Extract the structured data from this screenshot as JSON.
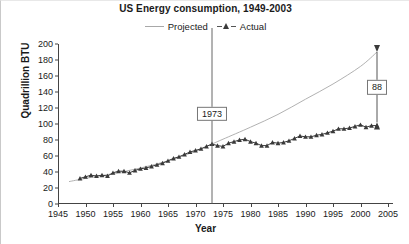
{
  "chart_data": {
    "type": "line",
    "title": "US Energy consumption, 1949-2003",
    "xlabel": "Year",
    "ylabel": "Quadrillion BTU",
    "xlim": [
      1945,
      2005
    ],
    "ylim": [
      0,
      200
    ],
    "xticks": [
      1945,
      1950,
      1955,
      1960,
      1965,
      1970,
      1975,
      1980,
      1985,
      1990,
      1995,
      2000,
      2005
    ],
    "yticks": [
      0,
      20,
      40,
      60,
      80,
      100,
      120,
      140,
      160,
      180,
      200
    ],
    "grid": false,
    "legend_position": "top-center",
    "legend": [
      "Projected",
      "Actual"
    ],
    "series": [
      {
        "name": "Projected",
        "color": "#a8a8a8",
        "marker": "none",
        "x": [
          1947,
          1950,
          1955,
          1960,
          1965,
          1970,
          1973,
          1975,
          1980,
          1985,
          1990,
          1995,
          2000,
          2003
        ],
        "values": [
          28,
          32,
          38,
          45,
          54,
          66,
          75,
          81,
          96,
          112,
          131,
          150,
          172,
          190
        ]
      },
      {
        "name": "Actual",
        "color": "#3a3a3a",
        "marker": "triangle",
        "x": [
          1949,
          1950,
          1951,
          1952,
          1953,
          1954,
          1955,
          1956,
          1957,
          1958,
          1959,
          1960,
          1961,
          1962,
          1963,
          1964,
          1965,
          1966,
          1967,
          1968,
          1969,
          1970,
          1971,
          1972,
          1973,
          1974,
          1975,
          1976,
          1977,
          1978,
          1979,
          1980,
          1981,
          1982,
          1983,
          1984,
          1985,
          1986,
          1987,
          1988,
          1989,
          1990,
          1991,
          1992,
          1993,
          1994,
          1995,
          1996,
          1997,
          1998,
          1999,
          2000,
          2001,
          2002,
          2003
        ],
        "values": [
          32,
          34,
          36,
          35,
          36,
          35,
          39,
          41,
          41,
          39,
          42,
          44,
          45,
          47,
          49,
          51,
          54,
          57,
          59,
          62,
          65,
          67,
          69,
          72,
          75,
          73,
          72,
          76,
          78,
          80,
          81,
          78,
          76,
          73,
          73,
          77,
          76,
          77,
          79,
          82,
          85,
          84,
          84,
          86,
          87,
          89,
          91,
          94,
          94,
          95,
          97,
          99,
          96,
          98,
          98
        ]
      }
    ],
    "annotations": [
      {
        "name": "year-marker",
        "label": "1973",
        "x": 1973,
        "type": "vertical-line-with-box",
        "box_y": 113
      },
      {
        "name": "gap-arrow",
        "label": "88",
        "x": 2003,
        "type": "double-arrow",
        "y_top": 190,
        "y_bottom": 102,
        "value": 88
      }
    ]
  }
}
